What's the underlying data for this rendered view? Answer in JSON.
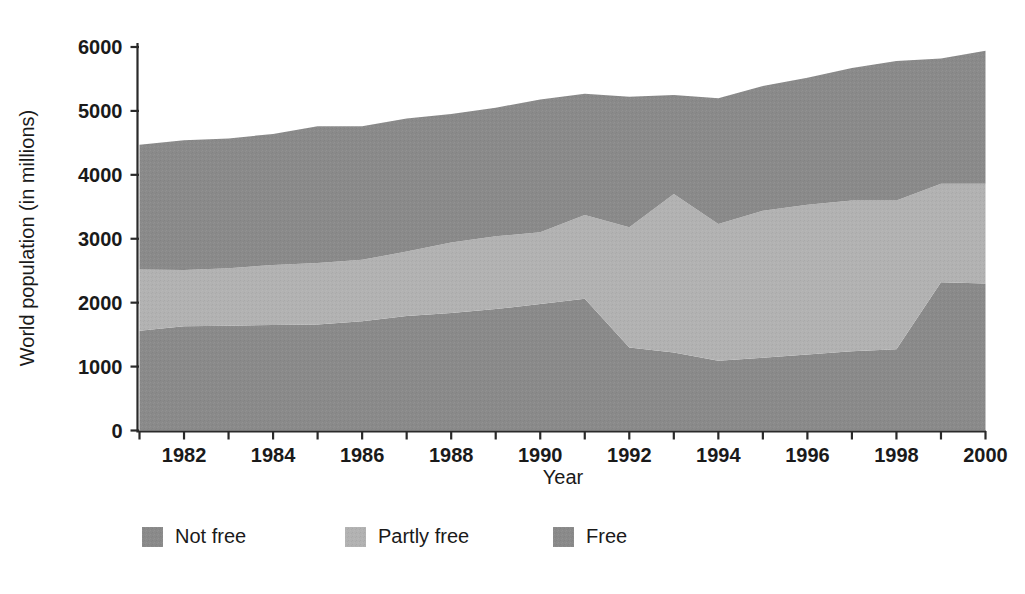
{
  "chart_data": {
    "type": "area",
    "title": "",
    "subtitle": "",
    "xlabel": "Year",
    "ylabel": "World population (in millions)",
    "xlim": [
      1981,
      2000
    ],
    "ylim": [
      0,
      6000
    ],
    "grid": false,
    "stacked": true,
    "legend_position": "bottom",
    "x": [
      1981,
      1982,
      1983,
      1984,
      1985,
      1986,
      1987,
      1988,
      1989,
      1990,
      1991,
      1992,
      1993,
      1994,
      1995,
      1996,
      1997,
      1998,
      1999,
      2000
    ],
    "xtick_labels": [
      "1982",
      "1984",
      "1986",
      "1988",
      "1990",
      "1992",
      "1994",
      "1996",
      "1998",
      "2000"
    ],
    "xticks": [
      1982,
      1984,
      1986,
      1988,
      1990,
      1992,
      1994,
      1996,
      1998,
      2000
    ],
    "ytick_labels": [
      "0",
      "1000",
      "2000",
      "3000",
      "4000",
      "5000",
      "6000"
    ],
    "yticks": [
      0,
      1000,
      2000,
      3000,
      4000,
      5000,
      6000
    ],
    "series": [
      {
        "name": "Free",
        "color": "#8a8a8a",
        "values": [
          1560,
          1630,
          1640,
          1650,
          1660,
          1710,
          1790,
          1840,
          1900,
          1980,
          2060,
          1300,
          1220,
          1090,
          1140,
          1190,
          1240,
          1270,
          2320,
          2300
        ]
      },
      {
        "name": "Partly free",
        "color": "#b2b2b2",
        "values": [
          960,
          880,
          900,
          940,
          960,
          960,
          1010,
          1100,
          1140,
          1120,
          1310,
          1880,
          2480,
          2140,
          2300,
          2340,
          2360,
          2330,
          1540,
          1560
        ]
      },
      {
        "name": "Not free",
        "color": "#8a8a8a",
        "values": [
          1950,
          2030,
          2030,
          2050,
          2140,
          2090,
          2080,
          2010,
          2010,
          2080,
          1900,
          2040,
          1550,
          1970,
          1950,
          1990,
          2070,
          2180,
          1960,
          2080
        ]
      }
    ],
    "legend": [
      {
        "label": "Not free",
        "color": "#8a8a8a"
      },
      {
        "label": "Partly free",
        "color": "#b2b2b2"
      },
      {
        "label": "Free",
        "color": "#8a8a8a"
      }
    ]
  }
}
